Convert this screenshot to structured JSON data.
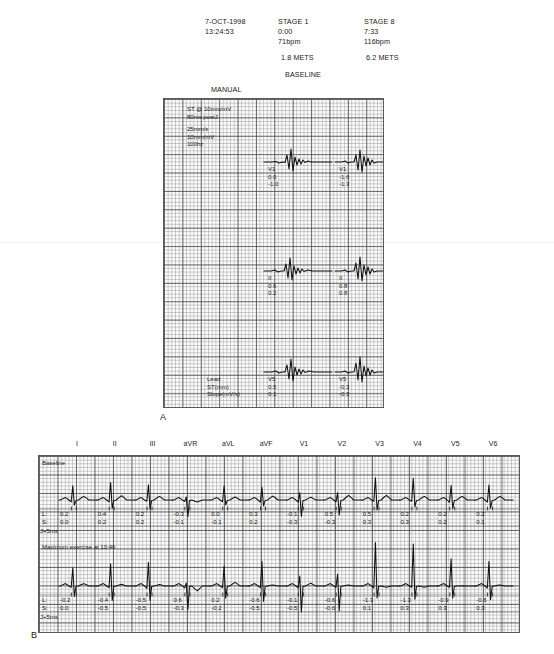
{
  "header": {
    "date": "7-OCT-1998",
    "time": "13:24:53",
    "stage1": {
      "name": "STAGE 1",
      "elapsed": "0:00",
      "hr": "71bpm",
      "mets": "1.8 METS"
    },
    "stage8": {
      "name": "STAGE 8",
      "elapsed": "7:33",
      "hr": "116bpm",
      "mets": "6.2 METS"
    },
    "baseline_label": "BASELINE",
    "manual_label": "MANUAL"
  },
  "panel_a": {
    "label": "A",
    "settings_lines": "ST @ 10mm/mV\n80ms postJ",
    "scale_lines": "25mm/s\n10mm/mV\n100hz",
    "row_labels": "Lead\nST(mm)\nSlope(mV/s)",
    "rows": [
      {
        "left": {
          "lead": "V1",
          "st": "0.0",
          "slope": "-1.0"
        },
        "right": {
          "lead": "V1",
          "st": "-1.6",
          "slope": "-1.3"
        }
      },
      {
        "left": {
          "lead": "II",
          "st": "0.6",
          "slope": "0.2"
        },
        "right": {
          "lead": "II",
          "st": "0.8",
          "slope": "0.8"
        }
      },
      {
        "left": {
          "lead": "V5",
          "st": "0.5",
          "slope": "0.1"
        },
        "right": {
          "lead": "V5",
          "st": "-0.3",
          "slope": "-0.3"
        }
      }
    ]
  },
  "panel_b": {
    "label": "B",
    "leads": [
      "I",
      "II",
      "III",
      "aVR",
      "aVL",
      "aVF",
      "V1",
      "V2",
      "V3",
      "V4",
      "V5",
      "V6"
    ],
    "row1": {
      "annotation": "Baseline",
      "l_label": "L:",
      "s_label": "S:",
      "j_label": "J+5ms",
      "l_values": [
        "0.2",
        "0.4",
        "0.2",
        "-0.3",
        "0.0",
        "0.3",
        "-0.1",
        "0.5",
        "0.5",
        "0.2",
        "0.2",
        "0.2"
      ],
      "s_values": [
        "0.0",
        "0.2",
        "0.2",
        "-0.1",
        "-0.1",
        "0.2",
        "-0.3",
        "-0.3",
        "0.3",
        "0.3",
        "0.2",
        "0.1"
      ]
    },
    "row2": {
      "annotation": "Maximum exercise at 10:46",
      "l_label": "L:",
      "s_label": "S:",
      "j_label": "J+5ms",
      "l_values": [
        "-0.2",
        "-0.4",
        "-0.5",
        "0.6",
        "0.2",
        "-0.6",
        "-0.1",
        "-0.6",
        "-1.3",
        "-1.3",
        "-0.9",
        "-0.6"
      ],
      "s_values": [
        "0.0",
        "-0.5",
        "-0.5",
        "-0.3",
        "-0.2",
        "-0.5",
        "-0.5",
        "-0.6",
        "0.1",
        "0.3",
        "0.3",
        "0.3"
      ]
    }
  },
  "chart_data": {
    "type": "line",
    "xlabel": "time",
    "ylabel": "amplitude (mV)",
    "paper_speed": "25mm/s",
    "gain": "10mm/mV",
    "filter": "100hz",
    "panel_a": {
      "type": "line",
      "description": "Averaged complexes, baseline (left column) vs peak stage (right column)",
      "series": [
        {
          "name": "V1 baseline",
          "lead": "V1",
          "st_mm": 0.0,
          "slope_mv_s": -1.0
        },
        {
          "name": "V1 stage8",
          "lead": "V1",
          "st_mm": -1.6,
          "slope_mv_s": -1.3
        },
        {
          "name": "II baseline",
          "lead": "II",
          "st_mm": 0.6,
          "slope_mv_s": 0.2
        },
        {
          "name": "II stage8",
          "lead": "II",
          "st_mm": 0.8,
          "slope_mv_s": 0.8
        },
        {
          "name": "V5 baseline",
          "lead": "V5",
          "st_mm": 0.5,
          "slope_mv_s": 0.1
        },
        {
          "name": "V5 stage8",
          "lead": "V5",
          "st_mm": -0.3,
          "slope_mv_s": -0.3
        }
      ]
    },
    "panel_b": {
      "type": "line",
      "categories": [
        "I",
        "II",
        "III",
        "aVR",
        "aVL",
        "aVF",
        "V1",
        "V2",
        "V3",
        "V4",
        "V5",
        "V6"
      ],
      "series": [
        {
          "name": "Baseline L",
          "values": [
            0.2,
            0.4,
            0.2,
            -0.3,
            0.0,
            0.3,
            -0.1,
            0.5,
            0.5,
            0.2,
            0.2,
            0.2
          ]
        },
        {
          "name": "Baseline S",
          "values": [
            0.0,
            0.2,
            0.2,
            -0.1,
            -0.1,
            0.2,
            -0.3,
            -0.3,
            0.3,
            0.3,
            0.2,
            0.1
          ]
        },
        {
          "name": "Max exercise L",
          "values": [
            -0.2,
            -0.4,
            -0.5,
            0.6,
            0.2,
            -0.6,
            -0.1,
            -0.6,
            -1.3,
            -1.3,
            -0.9,
            -0.6
          ]
        },
        {
          "name": "Max exercise S",
          "values": [
            0.0,
            -0.5,
            -0.5,
            -0.3,
            -0.2,
            -0.5,
            -0.5,
            -0.6,
            0.1,
            0.3,
            0.3,
            0.3
          ]
        }
      ],
      "grid": true,
      "legend": "none"
    }
  }
}
